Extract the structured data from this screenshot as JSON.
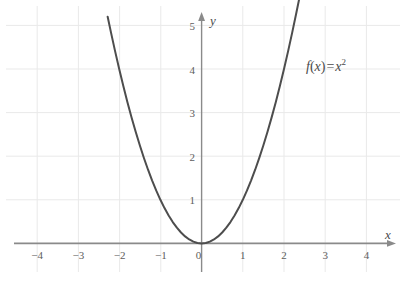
{
  "chart_data": {
    "type": "line",
    "title": "",
    "subtitle": "",
    "xlabel": "x",
    "ylabel": "y",
    "xlim": [
      -4.4,
      4.5
    ],
    "ylim": [
      -0.45,
      5.45
    ],
    "grid": true,
    "legend": null,
    "annotations": [
      {
        "name": "function-formula",
        "parts": {
          "fname": "f",
          "lparen": "(",
          "arg": "x",
          "rparen": ")",
          "equals": "=",
          "base": "x",
          "exponent": "2"
        },
        "text": "f(x) = x²",
        "x": 3.55,
        "y": 4.15
      }
    ],
    "xticks": [
      -4,
      -3,
      -2,
      -1,
      0,
      1,
      2,
      3,
      4
    ],
    "xtick_labels": [
      "−4",
      "−3",
      "−2",
      "−1",
      "0",
      "1",
      "2",
      "3",
      "4"
    ],
    "yticks": [
      1,
      2,
      3,
      4,
      5
    ],
    "ytick_labels": [
      "1",
      "2",
      "3",
      "4",
      "5"
    ],
    "origin_label": "0",
    "series": [
      {
        "name": "f(x) = x^2",
        "equation": "y = x^2",
        "color": "#4d4d4d",
        "linewidth": 2,
        "x": [
          -2.28,
          -2.2,
          -2.1,
          -2.0,
          -1.9,
          -1.8,
          -1.7,
          -1.6,
          -1.5,
          -1.4,
          -1.3,
          -1.2,
          -1.1,
          -1.0,
          -0.9,
          -0.8,
          -0.7,
          -0.6,
          -0.5,
          -0.4,
          -0.3,
          -0.2,
          -0.1,
          0.0,
          0.1,
          0.2,
          0.3,
          0.4,
          0.5,
          0.6,
          0.7,
          0.8,
          0.9,
          1.0,
          1.1,
          1.2,
          1.3,
          1.4,
          1.5,
          1.6,
          1.7,
          1.8,
          1.9,
          2.0,
          2.1,
          2.2,
          2.3,
          2.38
        ],
        "y": [
          5.2,
          4.84,
          4.41,
          4.0,
          3.61,
          3.24,
          2.89,
          2.56,
          2.25,
          1.96,
          1.69,
          1.44,
          1.21,
          1.0,
          0.81,
          0.64,
          0.49,
          0.36,
          0.25,
          0.16,
          0.09,
          0.04,
          0.01,
          0.0,
          0.01,
          0.04,
          0.09,
          0.16,
          0.25,
          0.36,
          0.49,
          0.64,
          0.81,
          1.0,
          1.21,
          1.44,
          1.69,
          1.96,
          2.25,
          2.56,
          2.89,
          3.24,
          3.61,
          4.0,
          4.41,
          4.84,
          5.29,
          5.66
        ]
      }
    ]
  },
  "style": {
    "background": "#ffffff",
    "grid_color": "#e9e9e9",
    "axis_color": "#8a8a8a",
    "curve_color": "#4d4d4d",
    "tick_text_color": "#5d5d5d"
  }
}
